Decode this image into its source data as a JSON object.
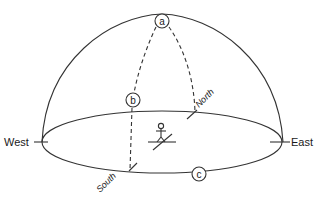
{
  "diagram": {
    "title": "",
    "labels": {
      "west": "West",
      "east": "East",
      "north": "North",
      "south": "South"
    },
    "markers": {
      "a": "a",
      "b": "b",
      "c": "c"
    },
    "colors": {
      "line": "#333333",
      "text": "#1a1a1a",
      "background": "#ffffff"
    },
    "icons": {
      "observer": "stick-figure-observer"
    }
  }
}
